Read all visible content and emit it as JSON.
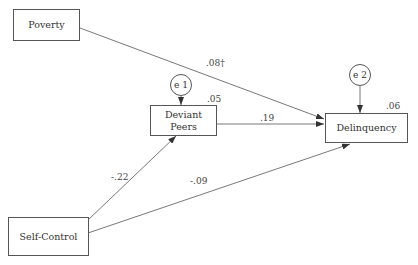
{
  "diagram": {
    "type": "path-model",
    "nodes": {
      "poverty": {
        "label": "Poverty"
      },
      "deviant_peers": {
        "label": "Deviant\nPeers",
        "r2": ".05"
      },
      "delinquency": {
        "label": "Delinquency",
        "r2": ".06"
      },
      "self_control": {
        "label": "Self-Control"
      },
      "e1": {
        "label": "e 1"
      },
      "e2": {
        "label": "e 2"
      }
    },
    "paths": [
      {
        "from": "Poverty",
        "to": "Delinquency",
        "coef": ".08†"
      },
      {
        "from": "Deviant Peers",
        "to": "Delinquency",
        "coef": ".19"
      },
      {
        "from": "Self-Control",
        "to": "Deviant Peers",
        "coef": "-.22"
      },
      {
        "from": "Self-Control",
        "to": "Delinquency",
        "coef": "-.09"
      },
      {
        "from": "e 1",
        "to": "Deviant Peers",
        "coef": ""
      },
      {
        "from": "e 2",
        "to": "Delinquency",
        "coef": ""
      }
    ],
    "colors": {
      "line": "#555555",
      "text": "#333333"
    }
  }
}
